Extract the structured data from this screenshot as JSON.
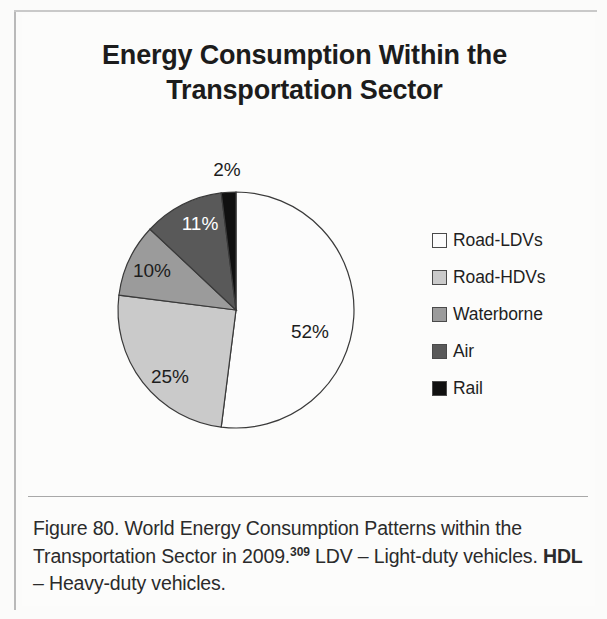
{
  "figure": {
    "title": "Energy Consumption Within the Transportation Sector",
    "title_line1": "Energy Consumption Within the",
    "title_line2": "Transportation Sector"
  },
  "caption": {
    "part1": "Figure 80. World Energy Consumption Patterns within the Transportation Sector in 2009.",
    "superscript": "309",
    "part2": " LDV – Light-duty vehicles. ",
    "bold_term": "HDL",
    "part3": " – Heavy-duty vehicles."
  },
  "legend": {
    "items": [
      {
        "label": "Road-LDVs",
        "color": "#fcfcfc"
      },
      {
        "label": "Road-HDVs",
        "color": "#cacaca"
      },
      {
        "label": "Waterborne",
        "color": "#9b9b9b"
      },
      {
        "label": "Air",
        "color": "#595959"
      },
      {
        "label": "Rail",
        "color": "#101010"
      }
    ]
  },
  "chart_data": {
    "type": "pie",
    "title": "Energy Consumption Within the Transportation Sector",
    "subtitle": "",
    "categories": [
      "Road-LDVs",
      "Road-HDVs",
      "Waterborne",
      "Air",
      "Rail"
    ],
    "values": [
      52,
      25,
      10,
      11,
      2
    ],
    "unit": "%",
    "data_labels": [
      "52%",
      "25%",
      "10%",
      "11%",
      "2%"
    ],
    "colors": [
      "#fcfcfc",
      "#cacaca",
      "#9b9b9b",
      "#595959",
      "#101010"
    ],
    "label_text_colors": [
      "#1d1d1d",
      "#1d1d1d",
      "#1d1d1d",
      "#ffffff",
      "#1d1d1d"
    ],
    "start_angle_deg": 0,
    "direction": "clockwise",
    "legend_position": "right",
    "grid": false,
    "slice_outline_color": "#3a3a3a",
    "label_positions": [
      {
        "label": "52%",
        "x": 310,
        "y": 338,
        "anchor": "middle",
        "tone": "dark"
      },
      {
        "label": "25%",
        "x": 170,
        "y": 383,
        "anchor": "middle",
        "tone": "dark"
      },
      {
        "label": "10%",
        "x": 152,
        "y": 277,
        "anchor": "middle",
        "tone": "dark"
      },
      {
        "label": "11%",
        "x": 200,
        "y": 230,
        "anchor": "middle",
        "tone": "light"
      },
      {
        "label": "2%",
        "x": 227,
        "y": 176,
        "anchor": "middle",
        "tone": "dark"
      }
    ],
    "geometry": {
      "cx": 236,
      "cy": 310,
      "r": 118
    }
  }
}
